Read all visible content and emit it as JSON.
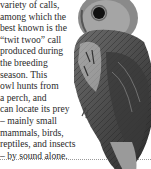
{
  "article": {
    "lines": [
      "variety of calls,",
      "among which the",
      "best known is the",
      "“twit twoo” call",
      "produced during",
      "the breeding",
      "season. This",
      "owl hunts from",
      "a perch, and",
      "can locate its prey",
      "– mainly small",
      "mammals, birds,",
      "reptiles, and insects",
      "– by sound alone."
    ]
  }
}
